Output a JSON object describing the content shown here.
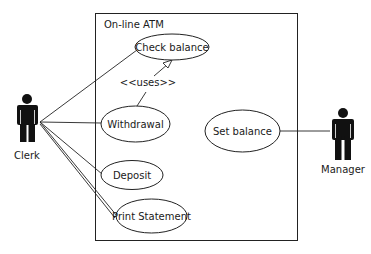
{
  "diagram": {
    "type": "uml-use-case",
    "system": {
      "name": "On-line ATM"
    },
    "actors": [
      {
        "id": "clerk",
        "label": "Clerk"
      },
      {
        "id": "manager",
        "label": "Manager"
      }
    ],
    "use_cases": [
      {
        "id": "check_balance",
        "label": "Check balance"
      },
      {
        "id": "withdrawal",
        "label": "Withdrawal"
      },
      {
        "id": "deposit",
        "label": "Deposit"
      },
      {
        "id": "print_statement",
        "label": "Print Statement"
      },
      {
        "id": "set_balance",
        "label": "Set balance"
      }
    ],
    "relationships": [
      {
        "from": "clerk",
        "to": "check_balance",
        "type": "association"
      },
      {
        "from": "clerk",
        "to": "withdrawal",
        "type": "association"
      },
      {
        "from": "clerk",
        "to": "deposit",
        "type": "association"
      },
      {
        "from": "clerk",
        "to": "print_statement",
        "type": "association"
      },
      {
        "from": "manager",
        "to": "set_balance",
        "type": "association"
      },
      {
        "from": "withdrawal",
        "to": "check_balance",
        "type": "uses",
        "label": "<<uses>>"
      }
    ]
  }
}
